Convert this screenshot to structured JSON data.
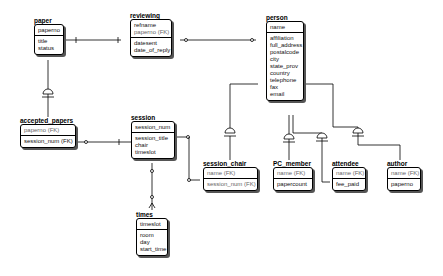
{
  "diagram": {
    "type": "entity-relationship (IDEF1X)",
    "entities": [
      {
        "name": "paper",
        "keys": [
          "paperno"
        ],
        "attributes": [
          "title",
          "status"
        ]
      },
      {
        "name": "reviewing",
        "keys": [
          "refname",
          "paperno (FK)"
        ],
        "attributes": [
          "datesent",
          "date_of_reply"
        ]
      },
      {
        "name": "person",
        "keys": [
          "name"
        ],
        "attributes": [
          "affiliation",
          "full_address",
          "postalcode",
          "city",
          "state_prov",
          "country",
          "telephone",
          "fax",
          "email"
        ]
      },
      {
        "name": "accepted_papers",
        "keys": [
          "paperno (FK)"
        ],
        "attributes": [
          "session_num (FK)"
        ]
      },
      {
        "name": "session",
        "keys": [
          "session_num"
        ],
        "attributes": [
          "session_title",
          "chair",
          "timeslot"
        ]
      },
      {
        "name": "times",
        "keys": [
          "timeslot"
        ],
        "attributes": [
          "room",
          "day",
          "start_time"
        ]
      },
      {
        "name": "session_chair",
        "keys": [
          "name (FK)"
        ],
        "attributes": [
          "session_num (FK)"
        ]
      },
      {
        "name": "PC_member",
        "keys": [
          "name (FK)"
        ],
        "attributes": [
          "papercount"
        ]
      },
      {
        "name": "attendee",
        "keys": [
          "name (FK)"
        ],
        "attributes": [
          "fee_paid"
        ]
      },
      {
        "name": "author",
        "keys": [
          "name (FK)"
        ],
        "attributes": [
          "paperno"
        ]
      }
    ],
    "relationships": [
      {
        "from": "paper",
        "to": "reviewing",
        "type": "one-to-many"
      },
      {
        "from": "person",
        "to": "reviewing",
        "type": "one-to-many"
      },
      {
        "from": "paper",
        "to": "accepted_papers",
        "type": "subtype"
      },
      {
        "from": "session",
        "to": "accepted_papers",
        "type": "one-to-many"
      },
      {
        "from": "times",
        "to": "session",
        "type": "one-to-many"
      },
      {
        "from": "session",
        "to": "session_chair",
        "type": "one-to-many"
      },
      {
        "from": "person",
        "to": "session_chair",
        "type": "subtype"
      },
      {
        "from": "person",
        "to": "PC_member",
        "type": "subtype"
      },
      {
        "from": "person",
        "to": "attendee",
        "type": "subtype"
      },
      {
        "from": "person",
        "to": "author",
        "type": "subtype"
      }
    ]
  }
}
